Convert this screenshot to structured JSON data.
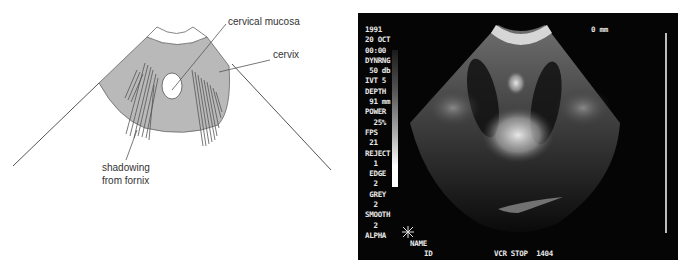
{
  "diagram": {
    "labels": {
      "mucosa": "cervical mucosa",
      "cervix": "cervix",
      "shadow_line1": "shadowing",
      "shadow_line2": "from fornix"
    },
    "colors": {
      "tissue_fill": "#b9b9b9",
      "line": "#555555"
    }
  },
  "ultrasound": {
    "settings": [
      "1991",
      "20 OCT",
      "00:00",
      "DYNRNG",
      " 50 db",
      "IVT 5",
      "DEPTH",
      " 91 mm",
      "POWER",
      "  25%",
      "FPS",
      " 21",
      "REJECT",
      "  1",
      " EDGE",
      "  2",
      " GREY",
      "  2",
      "SMOOTH",
      "  2",
      "ALPHA"
    ],
    "depth_marker": "0 mm",
    "name_label": "NAME",
    "id_label": "ID",
    "asterisk": "*",
    "status": "VCR STOP  1404"
  }
}
